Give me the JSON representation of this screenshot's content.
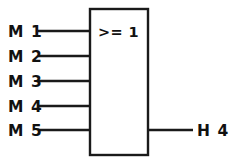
{
  "diagram": {
    "kind": "logic-gate-diagram",
    "gate": {
      "symbol": ">= 1",
      "type": "OR",
      "box": {
        "x": 90,
        "y": 9,
        "width": 58,
        "height": 146
      },
      "symbol_position": {
        "x": 98,
        "y": 37
      }
    },
    "inputs": [
      {
        "label": "M 1",
        "label_x": 8,
        "label_y": 37,
        "wire_y": 31,
        "wire_x1": 38,
        "wire_x2": 90
      },
      {
        "label": "M 2",
        "label_x": 8,
        "label_y": 62,
        "wire_y": 56,
        "wire_x1": 38,
        "wire_x2": 90
      },
      {
        "label": "M 3",
        "label_x": 8,
        "label_y": 87,
        "wire_y": 81,
        "wire_x1": 38,
        "wire_x2": 90
      },
      {
        "label": "M 4",
        "label_x": 8,
        "label_y": 112,
        "wire_y": 106,
        "wire_x1": 38,
        "wire_x2": 90
      },
      {
        "label": "M 5",
        "label_x": 8,
        "label_y": 136,
        "wire_y": 130,
        "wire_x1": 38,
        "wire_x2": 90
      }
    ],
    "outputs": [
      {
        "label": "H 4",
        "label_x": 197,
        "label_y": 136,
        "wire_y": 130,
        "wire_x1": 148,
        "wire_x2": 193
      }
    ],
    "colors": {
      "background": "#ffffff",
      "stroke": "#1a1a1a",
      "text": "#111111"
    }
  }
}
